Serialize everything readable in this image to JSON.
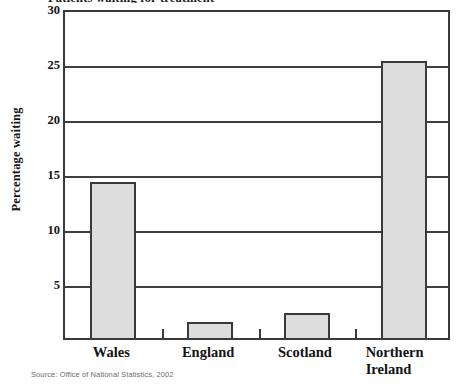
{
  "figure": {
    "title": "Patients waiting for treatment",
    "source_note": "Source: Office of National Statistics, 2002",
    "colors": {
      "bar_fill": "#dddddd",
      "bar_stroke": "#3a3a3a",
      "axis": "#3f3f3f",
      "text": "#141414",
      "source_text": "#6d6d6d"
    }
  },
  "axes": {
    "y_title": "Percentage waiting",
    "y_ticks": [
      "30",
      "25",
      "20",
      "15",
      "10",
      "5"
    ],
    "x_labels": [
      {
        "line1": "Wales",
        "line2": ""
      },
      {
        "line1": "England",
        "line2": ""
      },
      {
        "line1": "Scotland",
        "line2": ""
      },
      {
        "line1": "Northern",
        "line2": "Ireland"
      }
    ]
  },
  "chart_data": {
    "type": "bar",
    "title": "Patients waiting for treatment",
    "xlabel": "",
    "ylabel": "Percentage waiting",
    "categories": [
      "Wales",
      "England",
      "Scotland",
      "Northern Ireland"
    ],
    "values": [
      14.2,
      1.5,
      2.3,
      25.2
    ],
    "ylim": [
      0,
      30
    ],
    "yticks": [
      5,
      10,
      15,
      20,
      25,
      30
    ],
    "grid": true,
    "legend": false,
    "source": "Source: Office of National Statistics, 2002"
  }
}
